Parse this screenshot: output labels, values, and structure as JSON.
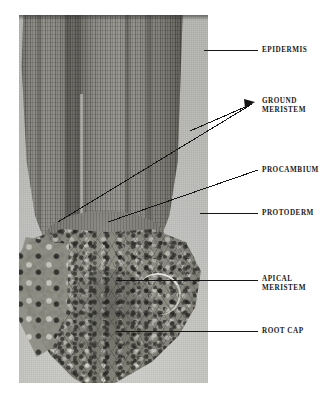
{
  "figure": {
    "type": "light-micrograph",
    "background_color": "#ffffff",
    "plate": {
      "x": 19,
      "y": 15,
      "width": 189,
      "height": 368,
      "slide_background_color": "#c4c4c1",
      "tissue_color_dark": "#46453f",
      "tissue_color_light": "#95948e"
    }
  },
  "labels": [
    {
      "id": "epidermis",
      "text": "EPIDERMIS",
      "lines": [
        "EPIDERMIS"
      ]
    },
    {
      "id": "ground-meristem",
      "text": "GROUND MERISTEM",
      "lines": [
        "GROUND",
        "MERISTEM"
      ]
    },
    {
      "id": "procambium",
      "text": "PROCAMBIUM",
      "lines": [
        "PROCAMBIUM"
      ]
    },
    {
      "id": "protoderm",
      "text": "PROTODERM",
      "lines": [
        "PROTODERM"
      ]
    },
    {
      "id": "apical-meristem",
      "text": "APICAL MERISTEM",
      "lines": [
        "APICAL",
        "MERISTEM"
      ]
    },
    {
      "id": "root-cap",
      "text": "ROOT CAP",
      "lines": [
        "ROOT CAP"
      ]
    }
  ],
  "label_text": {
    "epidermis": "EPIDERMIS",
    "ground_line1": "GROUND",
    "ground_line2": "MERISTEM",
    "procambium": "PROCAMBIUM",
    "protoderm": "PROTODERM",
    "apical_line1": "APICAL",
    "apical_line2": "MERISTEM",
    "root_cap": "ROOT CAP"
  },
  "leader_lines": {
    "stroke_color": "#151515",
    "stroke_width": 1,
    "items": [
      {
        "id": "epidermis",
        "style": "straight-horizontal",
        "from": [
          204,
          50
        ],
        "to": [
          258,
          50
        ]
      },
      {
        "id": "ground-meristem-upper",
        "style": "arrow-converging",
        "from": [
          190,
          131
        ],
        "to": [
          253,
          103
        ]
      },
      {
        "id": "ground-meristem-lower",
        "style": "arrow-converging",
        "from": [
          58,
          222
        ],
        "to": [
          253,
          103
        ]
      },
      {
        "id": "procambium",
        "style": "diagonal",
        "from": [
          108,
          222
        ],
        "to": [
          258,
          170
        ]
      },
      {
        "id": "protoderm",
        "style": "straight-horizontal",
        "from": [
          200,
          213
        ],
        "to": [
          258,
          213
        ]
      },
      {
        "id": "apical-meristem",
        "style": "straight-horizontal",
        "from": [
          116,
          280
        ],
        "to": [
          258,
          280
        ]
      },
      {
        "id": "root-cap",
        "style": "straight-horizontal",
        "from": [
          116,
          331
        ],
        "to": [
          258,
          331
        ]
      }
    ]
  }
}
